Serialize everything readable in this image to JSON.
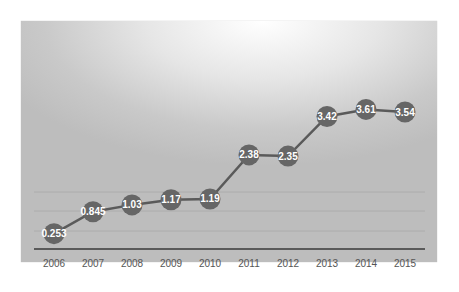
{
  "chart_data": {
    "type": "line",
    "title": "",
    "xlabel": "",
    "ylabel": "",
    "categories": [
      "2006",
      "2007",
      "2008",
      "2009",
      "2010",
      "2011",
      "2012",
      "2013",
      "2014",
      "2015"
    ],
    "series": [
      {
        "name": "",
        "values": [
          0.253,
          0.845,
          1.03,
          1.17,
          1.19,
          2.38,
          2.35,
          3.42,
          3.61,
          3.54
        ],
        "labels": [
          "0.253",
          "0.845",
          "1.03",
          "1.17",
          "1.19",
          "2.38",
          "2.35",
          "3.42",
          "3.61",
          "3.54"
        ]
      }
    ],
    "ylim": [
      0,
      6
    ],
    "grid": true,
    "legend": "none",
    "data_labels": true,
    "colors": {
      "line": "#5a5a5a",
      "marker": "#666666",
      "label_text": "#ffffff",
      "tick_text": "#555555",
      "axis": "#3a3a3a",
      "grid": "#a8a8a8"
    }
  }
}
